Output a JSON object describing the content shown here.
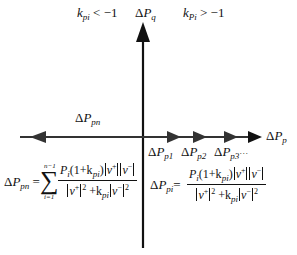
{
  "diagram": {
    "type": "vector-axes",
    "region_labels": {
      "left": {
        "k": "k",
        "sub": "pi",
        "rel": " < −1"
      },
      "right": {
        "k": "k",
        "sub": "Pi",
        "rel": " > −1"
      }
    },
    "axes": {
      "vertical": {
        "delta": "Δ",
        "var": "P",
        "sub": "q"
      },
      "horizontal": {
        "delta": "Δ",
        "var": "P",
        "sub": "p"
      }
    },
    "vectors": {
      "negative": {
        "delta": "Δ",
        "var": "P",
        "sub": "pn"
      },
      "positive": [
        {
          "delta": "Δ",
          "var": "P",
          "sub": "p1"
        },
        {
          "delta": "Δ",
          "var": "P",
          "sub": "p2"
        },
        {
          "delta": "Δ",
          "var": "P",
          "sub": "p3"
        }
      ],
      "ellipsis": "···"
    },
    "formulas": {
      "pn": {
        "lhs_delta": "Δ",
        "lhs_var": "P",
        "lhs_sub": "pn",
        "eq": "=",
        "sum_upper": "n−1",
        "sum_lower": "i=1",
        "sum_symbol": "∑",
        "num_a": "P",
        "num_a_sub": "i",
        "num_b": "(1+k",
        "num_b_sub": "pi",
        "num_c": ")",
        "v_plus": "v",
        "plus": "+",
        "v_minus": "v",
        "minus": "−",
        "den_k": " +k",
        "den_k_sub": "pi",
        "sq": "2"
      },
      "pi": {
        "lhs_delta": "Δ",
        "lhs_var": "P",
        "lhs_sub": "pi",
        "eq": "=",
        "num_a": "P",
        "num_a_sub": "i",
        "num_b": "(1+k",
        "num_b_sub": "pi",
        "num_c": ")",
        "v_plus": "v",
        "plus": "+",
        "v_minus": "v",
        "minus": "−",
        "den_k": " +k",
        "den_k_sub": "pi",
        "sq": "2"
      }
    }
  }
}
